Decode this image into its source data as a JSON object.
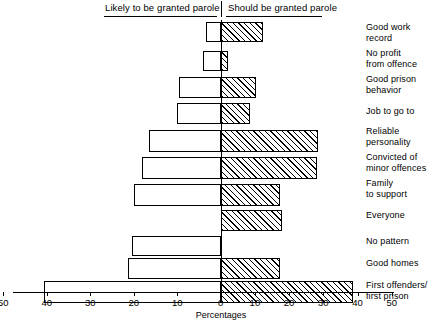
{
  "chart_data": {
    "type": "bar",
    "orientation": "horizontal",
    "layout": "diverging-bidirectional",
    "title": "",
    "xlabel": "Percentages",
    "ylabel": "",
    "grid": false,
    "legend_position": "top",
    "left_axis_label": "Likely to be granted parole",
    "right_axis_label": "Should be granted parole",
    "left_xlim": [
      0,
      50
    ],
    "right_xlim": [
      0,
      50
    ],
    "left_ticks": [
      50,
      40,
      30,
      20,
      10,
      0
    ],
    "right_ticks": [
      0,
      10,
      20,
      30,
      40,
      50
    ],
    "categories": [
      "Good work\nrecord",
      "No profit\nfrom offence",
      "Good prison\nbehavior",
      "Job to go to",
      "Reliable\npersonality",
      "Convicted of\nminor offences",
      "Family\nto support",
      "Everyone",
      "No pattern",
      "Good homes",
      "First offenders/\nfirst prison"
    ],
    "series": [
      {
        "name": "Likely to be granted parole",
        "fill": "white",
        "values": [
          3.4,
          4.0,
          9.6,
          10.0,
          16.5,
          18.0,
          20.0,
          0,
          20.4,
          21.2,
          40.6
        ]
      },
      {
        "name": "Should be granted parole",
        "fill": "hatched",
        "values": [
          12.3,
          2.2,
          10.3,
          8.5,
          28.5,
          28.2,
          17.3,
          18.0,
          0,
          17.3,
          38.7
        ]
      }
    ]
  },
  "colors": {
    "ink": "#000000",
    "background": "#ffffff"
  },
  "axis": {
    "title": "Percentages",
    "tick_labels_left": [
      "50",
      "40",
      "30",
      "20",
      "10",
      "0"
    ],
    "tick_labels_right": [
      "10",
      "20",
      "30",
      "40",
      "50"
    ]
  }
}
